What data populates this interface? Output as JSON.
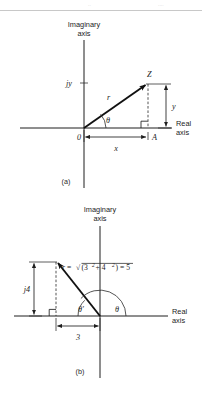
{
  "figure": {
    "kind": "argand-diagram-pair",
    "background_color": "#ffffff",
    "ink_color": "#1c1c1c",
    "top_rule_color": "#c8c8c8",
    "ghost_fragment_left": "..",
    "ghost_fragment_right": "...."
  },
  "panel_a": {
    "caption": "(a)",
    "imaginary_axis_line1": "Imaginary",
    "imaginary_axis_line2": "axis",
    "real_axis_line1": "Real",
    "real_axis_line2": "axis",
    "origin_label": "0",
    "point_label": "Z",
    "foot_label": "A",
    "modulus_label": "r",
    "angle_label": "θ",
    "imag_tick_label": "jy",
    "horizontal_dim_label": "x",
    "vertical_dim_label": "y"
  },
  "panel_b": {
    "caption": "(b)",
    "imaginary_axis_line1": "Imaginary",
    "imaginary_axis_line2": "axis",
    "real_axis_line1": "Real",
    "real_axis_line2": "axis",
    "modulus_formula_lhs": "r",
    "modulus_formula_eq1": " = ",
    "modulus_formula_radical": "√",
    "modulus_formula_open": "(3",
    "modulus_formula_exp1": "2",
    "modulus_formula_plus": " + 4",
    "modulus_formula_exp2": "2",
    "modulus_formula_close": ")",
    "modulus_formula_eq2": " = 5",
    "modulus_formula_plain": "r = √(3² + 4²) = 5",
    "imag_dim_label": "j4",
    "real_dim_label": "3",
    "angle_primary_label": "θ",
    "angle_reference_label": "θ′"
  },
  "geometry_a": {
    "origin_x": 84,
    "origin_y": 128,
    "point_z_x": 148,
    "point_z_y": 83,
    "foot_a_x": 148,
    "foot_a_y": 128
  },
  "geometry_b": {
    "origin_x": 100,
    "origin_y": 316,
    "point_x": 56,
    "point_y": 261,
    "foot_x": 56,
    "foot_y": 316
  }
}
